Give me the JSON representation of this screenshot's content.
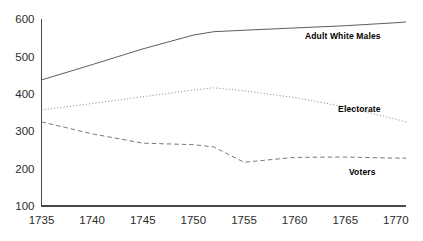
{
  "chart_data": {
    "type": "line",
    "title": "",
    "subtitle": "",
    "xlabel": "",
    "ylabel": "",
    "xlim": [
      1735,
      1771
    ],
    "ylim": [
      100,
      600
    ],
    "grid": false,
    "legend_position": "inline-right-of-series",
    "x_ticks": [
      "1735",
      "1740",
      "1745",
      "1750",
      "1755",
      "1760",
      "1765",
      "1770"
    ],
    "x_tick_values": [
      1735,
      1740,
      1745,
      1750,
      1755,
      1760,
      1765,
      1770
    ],
    "y_ticks": [
      "100",
      "200",
      "300",
      "400",
      "500",
      "600"
    ],
    "y_tick_values": [
      100,
      200,
      300,
      400,
      500,
      600
    ],
    "x": [
      1735,
      1740,
      1745,
      1750,
      1752,
      1755,
      1760,
      1765,
      1770,
      1771
    ],
    "series": [
      {
        "name": "Adult White Males",
        "label": "Adult White Males",
        "style": "solid",
        "color": "#555555",
        "values": [
          437,
          478,
          520,
          557,
          566,
          570,
          576,
          582,
          590,
          592
        ],
        "label_x": 1768.5,
        "label_y": 547
      },
      {
        "name": "Electorate",
        "label": "Electorate",
        "style": "dotted",
        "color": "#777777",
        "values": [
          357,
          374,
          392,
          410,
          416,
          408,
          390,
          365,
          332,
          325
        ],
        "label_x": 1768.5,
        "label_y": 352
      },
      {
        "name": "Voters",
        "label": "Voters",
        "style": "dashed",
        "color": "#777777",
        "values": [
          325,
          293,
          268,
          264,
          258,
          217,
          230,
          231,
          228,
          228
        ],
        "label_x": 1768.0,
        "label_y": 184
      }
    ]
  }
}
